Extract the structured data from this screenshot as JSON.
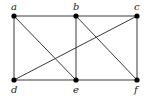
{
  "graph": {
    "nodes": [
      {
        "id": "a",
        "label": "a",
        "x": 14,
        "y": 16,
        "lx": 11,
        "ly": 10
      },
      {
        "id": "b",
        "label": "b",
        "x": 76,
        "y": 16,
        "lx": 73,
        "ly": 10
      },
      {
        "id": "c",
        "label": "c",
        "x": 137,
        "y": 16,
        "lx": 134,
        "ly": 10
      },
      {
        "id": "d",
        "label": "d",
        "x": 14,
        "y": 80,
        "lx": 11,
        "ly": 93
      },
      {
        "id": "e",
        "label": "e",
        "x": 76,
        "y": 80,
        "lx": 73,
        "ly": 93
      },
      {
        "id": "f",
        "label": "f",
        "x": 137,
        "y": 80,
        "lx": 134,
        "ly": 93
      }
    ],
    "edges": [
      [
        "a",
        "b"
      ],
      [
        "b",
        "c"
      ],
      [
        "a",
        "d"
      ],
      [
        "d",
        "e"
      ],
      [
        "e",
        "f"
      ],
      [
        "c",
        "f"
      ],
      [
        "b",
        "e"
      ],
      [
        "a",
        "e"
      ],
      [
        "b",
        "f"
      ],
      [
        "c",
        "d"
      ]
    ]
  }
}
